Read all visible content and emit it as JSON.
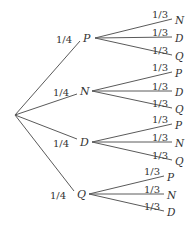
{
  "diagram": {
    "type": "probability-tree",
    "root": {
      "x": 15,
      "y": 115
    },
    "branches": [
      {
        "label": "P",
        "prob": "1/4",
        "node": {
          "x": 88,
          "y": 38
        },
        "children": [
          {
            "label": "N",
            "prob": "1/3",
            "y": 19
          },
          {
            "label": "D",
            "prob": "1/3",
            "y": 37
          },
          {
            "label": "Q",
            "prob": "1/3",
            "y": 55
          }
        ]
      },
      {
        "label": "N",
        "prob": "1/4",
        "node": {
          "x": 85,
          "y": 91
        },
        "children": [
          {
            "label": "P",
            "prob": "1/3",
            "y": 72
          },
          {
            "label": "D",
            "prob": "1/3",
            "y": 91
          },
          {
            "label": "Q",
            "prob": "1/3",
            "y": 108
          }
        ]
      },
      {
        "label": "D",
        "prob": "1/4",
        "node": {
          "x": 85,
          "y": 142
        },
        "children": [
          {
            "label": "P",
            "prob": "1/3",
            "y": 124
          },
          {
            "label": "N",
            "prob": "1/3",
            "y": 142
          },
          {
            "label": "Q",
            "prob": "1/3",
            "y": 160
          }
        ]
      },
      {
        "label": "Q",
        "prob": "1/4",
        "node": {
          "x": 82,
          "y": 194
        },
        "children": [
          {
            "label": "P",
            "prob": "1/3",
            "y": 176
          },
          {
            "label": "N",
            "prob": "1/3",
            "y": 194
          },
          {
            "label": "D",
            "prob": "1/3",
            "y": 211
          }
        ]
      }
    ]
  }
}
